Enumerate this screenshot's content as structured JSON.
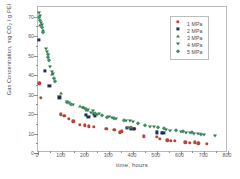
{
  "chart_data": {
    "type": "scatter",
    "title": "",
    "xlabel": "time, hours",
    "ylabel": "Gas Concentration, mg CO2 / g PEI",
    "ylabel_prefix": "Gas Concentration,  mg CO",
    "ylabel_sub": "2",
    "ylabel_suffix": " / g PEI",
    "xlim": [
      0,
      800
    ],
    "ylim": [
      0,
      75
    ],
    "xticks": [
      0,
      100,
      200,
      300,
      400,
      500,
      600,
      700,
      800
    ],
    "xticklabels": [
      "0",
      "100",
      "200",
      "300",
      "400",
      "500",
      "600",
      "700",
      "800"
    ],
    "yticks": [
      0,
      10,
      20,
      30,
      40,
      50,
      60,
      70
    ],
    "yticklabels": [
      "0",
      "10",
      "20",
      "30",
      "40",
      "50",
      "60",
      "70"
    ],
    "grid": false,
    "legend_position": "upper right",
    "frame": true,
    "series": [
      {
        "name": "1 MPa",
        "label": "1 MPa",
        "color": "#b5443a",
        "marker": "circle",
        "points": [
          [
            5,
            35.8
          ],
          [
            12,
            28.2
          ],
          [
            95,
            19.8
          ],
          [
            110,
            19.2
          ],
          [
            130,
            17.5
          ],
          [
            148,
            16.2
          ],
          [
            175,
            14.6
          ],
          [
            196,
            14.2
          ],
          [
            215,
            13.8
          ],
          [
            236,
            13.6
          ],
          [
            288,
            12.4
          ],
          [
            322,
            11.8
          ],
          [
            345,
            10.6
          ],
          [
            352,
            11.2
          ],
          [
            390,
            12.8
          ],
          [
            405,
            12.4
          ],
          [
            445,
            8.6
          ],
          [
            500,
            8.2
          ],
          [
            512,
            7.4
          ],
          [
            545,
            6.6
          ],
          [
            560,
            6.4
          ],
          [
            575,
            6.2
          ],
          [
            620,
            5.4
          ],
          [
            640,
            5.2
          ],
          [
            660,
            5.4
          ],
          [
            675,
            5.0
          ],
          [
            710,
            4.8
          ]
        ]
      },
      {
        "name": "2 MPa",
        "label": "2 MPa",
        "color": "#1f2f56",
        "marker": "square",
        "points": [
          [
            4,
            58.2
          ],
          [
            30,
            42.2
          ],
          [
            48,
            34.6
          ],
          [
            90,
            28.6
          ],
          [
            200,
            19.4
          ],
          [
            212,
            18.6
          ],
          [
            235,
            20.2
          ],
          [
            238,
            19.0
          ],
          [
            375,
            12.8
          ],
          [
            390,
            12.6
          ],
          [
            405,
            12.4
          ],
          [
            500,
            10.6
          ],
          [
            520,
            10.2
          ],
          [
            528,
            10.4
          ]
        ]
      },
      {
        "name": "3 MPa",
        "label": "3 MPa",
        "color": "#4a7f4a",
        "marker": "triangle-up",
        "points": [
          [
            8,
            66.0
          ],
          [
            20,
            63.2
          ],
          [
            60,
            40.8
          ],
          [
            95,
            30.6
          ],
          [
            175,
            24.0
          ],
          [
            190,
            23.4
          ],
          [
            205,
            22.2
          ],
          [
            380,
            13.2
          ],
          [
            392,
            13.6
          ]
        ]
      },
      {
        "name": "4 MPa",
        "label": "4 MPa",
        "color": "#2f7a4a",
        "marker": "triangle-down",
        "points": [
          [
            6,
            71.8
          ],
          [
            10,
            70.4
          ],
          [
            14,
            66.6
          ],
          [
            18,
            65.8
          ],
          [
            35,
            53.2
          ],
          [
            38,
            52.0
          ],
          [
            52,
            44.2
          ],
          [
            58,
            41.8
          ],
          [
            62,
            40.4
          ],
          [
            120,
            26.4
          ],
          [
            132,
            25.6
          ],
          [
            148,
            24.6
          ],
          [
            188,
            23.2
          ],
          [
            196,
            22.6
          ],
          [
            210,
            22.0
          ],
          [
            225,
            20.6
          ],
          [
            232,
            21.4
          ],
          [
            248,
            19.6
          ],
          [
            258,
            20.2
          ],
          [
            300,
            18.4
          ],
          [
            312,
            18.0
          ],
          [
            330,
            17.4
          ],
          [
            372,
            16.6
          ],
          [
            386,
            16.2
          ],
          [
            398,
            15.8
          ],
          [
            470,
            13.6
          ],
          [
            490,
            13.2
          ],
          [
            540,
            11.6
          ],
          [
            556,
            11.4
          ],
          [
            600,
            11.0
          ],
          [
            622,
            10.4
          ],
          [
            640,
            10.2
          ],
          [
            658,
            9.8
          ],
          [
            672,
            9.6
          ],
          [
            700,
            9.2
          ],
          [
            745,
            8.8
          ]
        ]
      },
      {
        "name": "5 MPa",
        "label": "5 MPa",
        "color": "#3f8f6f",
        "marker": "diamond",
        "points": [
          [
            6,
            69.8
          ],
          [
            9,
            68.4
          ],
          [
            16,
            64.8
          ],
          [
            22,
            62.4
          ],
          [
            40,
            50.6
          ],
          [
            44,
            49.2
          ],
          [
            48,
            48.0
          ],
          [
            66,
            38.6
          ],
          [
            72,
            37.2
          ],
          [
            124,
            26.0
          ],
          [
            140,
            25.2
          ],
          [
            200,
            22.8
          ],
          [
            240,
            20.4
          ],
          [
            268,
            19.4
          ],
          [
            292,
            18.6
          ],
          [
            318,
            17.8
          ],
          [
            360,
            16.8
          ],
          [
            420,
            15.2
          ],
          [
            450,
            14.4
          ],
          [
            505,
            13.4
          ],
          [
            532,
            12.6
          ],
          [
            580,
            11.8
          ],
          [
            612,
            11.2
          ],
          [
            650,
            10.6
          ],
          [
            688,
            10.0
          ]
        ]
      }
    ]
  }
}
